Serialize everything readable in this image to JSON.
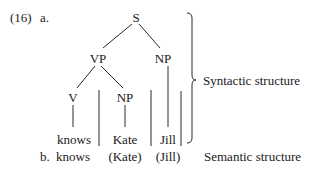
{
  "example": {
    "number": "(16)",
    "part_a_label": "a.",
    "part_b_label": "b."
  },
  "tree": {
    "root": "S",
    "vp": "VP",
    "np_subject": "NP",
    "v": "V",
    "np_object": "NP",
    "leaves": [
      "knows",
      "Kate",
      "Jill"
    ]
  },
  "labels": {
    "syntactic": "Syntactic structure",
    "semantic": "Semantic structure"
  },
  "semantic_line": [
    "knows",
    "(Kate)",
    "(Jill)"
  ],
  "colors": {
    "ink": "#1a1a1a",
    "background": "#ffffff"
  }
}
